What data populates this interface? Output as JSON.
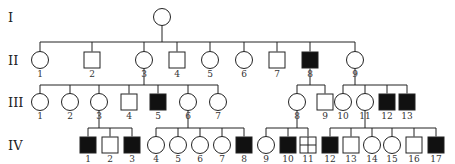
{
  "diagram": {
    "type": "pedigree",
    "generations": [
      {
        "label": "I",
        "y": 17
      },
      {
        "label": "II",
        "y": 60
      },
      {
        "label": "III",
        "y": 102
      },
      {
        "label": "IV",
        "y": 145
      }
    ],
    "colors": {
      "line": "#222222",
      "affected": "#111111",
      "unaffected": "#ffffff"
    },
    "individuals": [
      {
        "id": "I-1",
        "gen": 0,
        "num": "",
        "x": 162,
        "sex": "female",
        "status": "unaffected"
      },
      {
        "id": "II-1",
        "gen": 1,
        "num": "1",
        "x": 40,
        "sex": "female",
        "status": "unaffected"
      },
      {
        "id": "II-2",
        "gen": 1,
        "num": "2",
        "x": 92,
        "sex": "male",
        "status": "unaffected"
      },
      {
        "id": "II-3",
        "gen": 1,
        "num": "3",
        "x": 144,
        "sex": "female",
        "status": "unaffected"
      },
      {
        "id": "II-4",
        "gen": 1,
        "num": "4",
        "x": 177,
        "sex": "male",
        "status": "unaffected"
      },
      {
        "id": "II-5",
        "gen": 1,
        "num": "5",
        "x": 210,
        "sex": "female",
        "status": "unaffected"
      },
      {
        "id": "II-6",
        "gen": 1,
        "num": "6",
        "x": 244,
        "sex": "female",
        "status": "unaffected"
      },
      {
        "id": "II-7",
        "gen": 1,
        "num": "7",
        "x": 277,
        "sex": "male",
        "status": "unaffected"
      },
      {
        "id": "II-8",
        "gen": 1,
        "num": "8",
        "x": 310,
        "sex": "male",
        "status": "affected"
      },
      {
        "id": "II-9",
        "gen": 1,
        "num": "9",
        "x": 355,
        "sex": "female",
        "status": "unaffected"
      },
      {
        "id": "III-1",
        "gen": 2,
        "num": "1",
        "x": 40,
        "sex": "female",
        "status": "unaffected"
      },
      {
        "id": "III-2",
        "gen": 2,
        "num": "2",
        "x": 70,
        "sex": "female",
        "status": "unaffected"
      },
      {
        "id": "III-3",
        "gen": 2,
        "num": "3",
        "x": 99,
        "sex": "female",
        "status": "unaffected"
      },
      {
        "id": "III-4",
        "gen": 2,
        "num": "4",
        "x": 129,
        "sex": "male",
        "status": "unaffected"
      },
      {
        "id": "III-5",
        "gen": 2,
        "num": "5",
        "x": 158,
        "sex": "male",
        "status": "affected"
      },
      {
        "id": "III-6",
        "gen": 2,
        "num": "6",
        "x": 188,
        "sex": "female",
        "status": "unaffected"
      },
      {
        "id": "III-7",
        "gen": 2,
        "num": "7",
        "x": 218,
        "sex": "female",
        "status": "unaffected"
      },
      {
        "id": "III-8",
        "gen": 2,
        "num": "8",
        "x": 297,
        "sex": "female",
        "status": "unaffected"
      },
      {
        "id": "III-9",
        "gen": 2,
        "num": "9",
        "x": 325,
        "sex": "male",
        "status": "unaffected"
      },
      {
        "id": "III-10",
        "gen": 2,
        "num": "10",
        "x": 343,
        "sex": "female",
        "status": "unaffected"
      },
      {
        "id": "III-11",
        "gen": 2,
        "num": "11",
        "x": 365,
        "sex": "female",
        "status": "unaffected"
      },
      {
        "id": "III-12",
        "gen": 2,
        "num": "12",
        "x": 387,
        "sex": "male",
        "status": "affected"
      },
      {
        "id": "III-13",
        "gen": 2,
        "num": "13",
        "x": 407,
        "sex": "male",
        "status": "affected"
      },
      {
        "id": "IV-1",
        "gen": 3,
        "num": "1",
        "x": 88,
        "sex": "male",
        "status": "affected"
      },
      {
        "id": "IV-2",
        "gen": 3,
        "num": "2",
        "x": 110,
        "sex": "male",
        "status": "unaffected"
      },
      {
        "id": "IV-3",
        "gen": 3,
        "num": "3",
        "x": 132,
        "sex": "male",
        "status": "affected"
      },
      {
        "id": "IV-4",
        "gen": 3,
        "num": "4",
        "x": 156,
        "sex": "female",
        "status": "unaffected"
      },
      {
        "id": "IV-5",
        "gen": 3,
        "num": "5",
        "x": 178,
        "sex": "female",
        "status": "unaffected"
      },
      {
        "id": "IV-6",
        "gen": 3,
        "num": "6",
        "x": 200,
        "sex": "female",
        "status": "unaffected"
      },
      {
        "id": "IV-7",
        "gen": 3,
        "num": "7",
        "x": 222,
        "sex": "female",
        "status": "unaffected"
      },
      {
        "id": "IV-8",
        "gen": 3,
        "num": "8",
        "x": 244,
        "sex": "male",
        "status": "affected"
      },
      {
        "id": "IV-9",
        "gen": 3,
        "num": "9",
        "x": 266,
        "sex": "female",
        "status": "unaffected"
      },
      {
        "id": "IV-10",
        "gen": 3,
        "num": "10",
        "x": 288,
        "sex": "male",
        "status": "affected"
      },
      {
        "id": "IV-11",
        "gen": 3,
        "num": "11",
        "x": 308,
        "sex": "male",
        "status": "crossed"
      },
      {
        "id": "IV-12",
        "gen": 3,
        "num": "12",
        "x": 330,
        "sex": "male",
        "status": "affected"
      },
      {
        "id": "IV-13",
        "gen": 3,
        "num": "13",
        "x": 351,
        "sex": "male",
        "status": "unaffected"
      },
      {
        "id": "IV-14",
        "gen": 3,
        "num": "14",
        "x": 372,
        "sex": "female",
        "status": "unaffected"
      },
      {
        "id": "IV-15",
        "gen": 3,
        "num": "15",
        "x": 392,
        "sex": "female",
        "status": "unaffected"
      },
      {
        "id": "IV-16",
        "gen": 3,
        "num": "16",
        "x": 414,
        "sex": "male",
        "status": "unaffected"
      },
      {
        "id": "IV-17",
        "gen": 3,
        "num": "17",
        "x": 436,
        "sex": "male",
        "status": "affected"
      }
    ],
    "sibships": [
      {
        "parent": "I-1",
        "bar_y": 42,
        "children": [
          "II-1",
          "II-2",
          "II-3",
          "II-4",
          "II-5",
          "II-6",
          "II-7",
          "II-8",
          "II-9"
        ]
      },
      {
        "parent": "II-3",
        "bar_y": 85,
        "children": [
          "III-1",
          "III-2",
          "III-3",
          "III-4",
          "III-5",
          "III-6",
          "III-7"
        ]
      },
      {
        "parent": "II-8",
        "bar_y": 85,
        "children": [
          "III-8",
          "III-9"
        ]
      },
      {
        "parent": "II-9",
        "bar_y": 85,
        "children": [
          "III-10",
          "III-11",
          "III-12",
          "III-13"
        ]
      },
      {
        "parent": "III-3",
        "bar_y": 128,
        "children": [
          "IV-1",
          "IV-2",
          "IV-3"
        ]
      },
      {
        "parent": "III-6",
        "bar_y": 128,
        "children": [
          "IV-4",
          "IV-5",
          "IV-6",
          "IV-7",
          "IV-8"
        ]
      },
      {
        "parent": "III-8",
        "bar_y": 128,
        "children": [
          "IV-9",
          "IV-10",
          "IV-11"
        ]
      },
      {
        "parent": "III-11",
        "bar_y": 128,
        "children": [
          "IV-12",
          "IV-13",
          "IV-14",
          "IV-15",
          "IV-16",
          "IV-17"
        ]
      }
    ]
  }
}
